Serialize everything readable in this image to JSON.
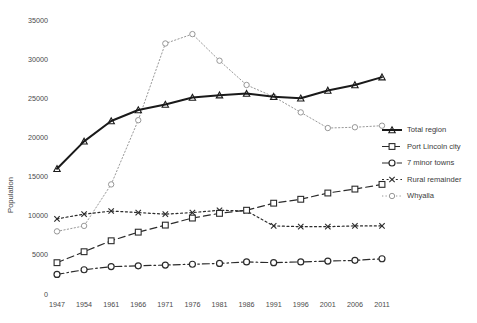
{
  "chart_data": {
    "type": "line",
    "title": "",
    "xlabel": "",
    "ylabel": "Population",
    "ylim": [
      0,
      35000
    ],
    "ytick_step": 5000,
    "yticks": [
      "0",
      "5000",
      "10000",
      "15000",
      "20000",
      "25000",
      "30000",
      "35000"
    ],
    "grid": false,
    "legend_position": "right",
    "categories": [
      "1947",
      "1954",
      "1961",
      "1966",
      "1971",
      "1976",
      "1981",
      "1986",
      "1991",
      "1996",
      "2001",
      "2006",
      "2011"
    ],
    "series": [
      {
        "name": "Total region",
        "marker": "triangle",
        "dash": "solid",
        "color": "#1a1a1a",
        "width": 2.0,
        "values": [
          16000,
          19500,
          22100,
          23500,
          24200,
          25100,
          25400,
          25600,
          25200,
          25000,
          26000,
          26700,
          27700
        ]
      },
      {
        "name": "Port Lincoln city",
        "marker": "square",
        "dash": "dashed",
        "color": "#2b2b2b",
        "width": 1.2,
        "values": [
          4000,
          5400,
          6800,
          7900,
          8800,
          9700,
          10300,
          10700,
          11600,
          12100,
          12900,
          13400,
          14000
        ]
      },
      {
        "name": "7 minor towns",
        "marker": "circle",
        "dash": "dashdot",
        "color": "#2b2b2b",
        "width": 1.2,
        "values": [
          2500,
          3100,
          3500,
          3600,
          3700,
          3800,
          3900,
          4100,
          4000,
          4100,
          4200,
          4300,
          4500
        ]
      },
      {
        "name": "Rural remainder",
        "marker": "x",
        "dash": "dotted",
        "color": "#2b2b2b",
        "width": 1.2,
        "values": [
          9600,
          10200,
          10600,
          10400,
          10200,
          10400,
          10700,
          10600,
          8700,
          8600,
          8600,
          8700,
          8700
        ]
      },
      {
        "name": "Whyalla",
        "marker": "opencircle",
        "dash": "fine-dotted",
        "color": "#8c8c8c",
        "width": 0.9,
        "values": [
          8000,
          8700,
          14000,
          22200,
          32000,
          33200,
          29800,
          26700,
          25200,
          23200,
          21200,
          21300,
          21500
        ]
      }
    ]
  },
  "legend": {
    "items": [
      {
        "label": "Total region"
      },
      {
        "label": "Port Lincoln city"
      },
      {
        "label": "7 minor towns"
      },
      {
        "label": "Rural remainder"
      },
      {
        "label": "Whyalla"
      }
    ]
  },
  "axes": {
    "y_title": "Population"
  }
}
